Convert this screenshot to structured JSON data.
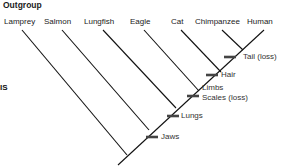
{
  "diagram": {
    "type": "cladogram",
    "title": "Outgroup",
    "left_edge_fragment": "IS",
    "taxa": [
      {
        "name": "Lamprey",
        "x": 4
      },
      {
        "name": "Salmon",
        "x": 44
      },
      {
        "name": "Lungfish",
        "x": 84
      },
      {
        "name": "Eagle",
        "x": 130
      },
      {
        "name": "Cat",
        "x": 171
      },
      {
        "name": "Chimpanzee",
        "x": 195
      },
      {
        "name": "Human",
        "x": 247
      }
    ],
    "traits": [
      {
        "label": "Tail (loss)",
        "x": 243,
        "y": 54
      },
      {
        "label": "Hair",
        "x": 220,
        "y": 72
      },
      {
        "label": "Limbs",
        "x": 202,
        "y": 85
      },
      {
        "label": "Scales (loss)",
        "x": 202,
        "y": 96
      },
      {
        "label": "Lungs",
        "x": 180,
        "y": 112
      },
      {
        "label": "Jaws",
        "x": 160,
        "y": 132
      }
    ],
    "line_color": "#111111",
    "tick_color": "#444444"
  }
}
